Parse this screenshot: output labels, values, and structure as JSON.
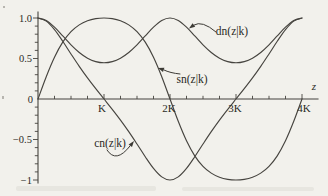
{
  "figure": {
    "background": "#f2f1ec",
    "ink": "#46443f",
    "text_color": "#2b2a25"
  },
  "chart_data": {
    "type": "line",
    "xlabel": "z",
    "x_unit_symbol": "K",
    "grid": false,
    "legend": "none (curves labeled with arrows)",
    "xlim_in_K": [
      0,
      4.25
    ],
    "ylim": [
      -1.05,
      1.05
    ],
    "x_minor_tick_step_in_K": 0.25,
    "y_minor_tick_step": 0.1,
    "x_ticks": [
      {
        "label": "K",
        "u": 1
      },
      {
        "label": "2K",
        "u": 2
      },
      {
        "label": "3K",
        "u": 3
      },
      {
        "label": "4K",
        "u": 4
      }
    ],
    "y_ticks": [
      {
        "label": "1.0",
        "v": 1
      },
      {
        "label": "0.5",
        "v": 0.5
      },
      {
        "label": "0",
        "v": 0
      },
      {
        "label": "−0.5",
        "v": -0.5
      },
      {
        "label": "−1",
        "v": -1
      }
    ],
    "u": [
      0,
      0.125,
      0.25,
      0.375,
      0.5,
      0.625,
      0.75,
      0.875,
      1,
      1.125,
      1.25,
      1.375,
      1.5,
      1.625,
      1.75,
      1.875,
      2,
      2.125,
      2.25,
      2.375,
      2.5,
      2.625,
      2.75,
      2.875,
      3,
      3.125,
      3.25,
      3.375,
      3.5,
      3.625,
      3.75,
      3.875,
      4
    ],
    "series": [
      {
        "name": "sn(z|k)",
        "values": [
          0,
          0.2756,
          0.5159,
          0.7015,
          0.8312,
          0.9153,
          0.9657,
          0.9919,
          1,
          0.9919,
          0.9657,
          0.9153,
          0.8312,
          0.7015,
          0.5159,
          0.2756,
          0,
          -0.2756,
          -0.5159,
          -0.7015,
          -0.8312,
          -0.9153,
          -0.9657,
          -0.9919,
          -1,
          -0.9919,
          -0.9657,
          -0.9153,
          -0.8312,
          -0.7015,
          -0.5159,
          -0.2756,
          0
        ]
      },
      {
        "name": "cn(z|k)",
        "values": [
          1,
          0.9613,
          0.8567,
          0.7127,
          0.5558,
          0.4029,
          0.2601,
          0.1271,
          0,
          -0.1271,
          -0.2601,
          -0.4029,
          -0.5558,
          -0.7127,
          -0.8567,
          -0.9613,
          -1,
          -0.9613,
          -0.8567,
          -0.7127,
          -0.5558,
          -0.4029,
          -0.2601,
          -0.1271,
          0,
          0.1271,
          0.2601,
          0.4029,
          0.5558,
          0.7127,
          0.8567,
          0.9613,
          1
        ]
      },
      {
        "name": "dn(z|k)",
        "values": [
          1,
          0.9691,
          0.8872,
          0.7787,
          0.6687,
          0.5743,
          0.5041,
          0.4615,
          0.4472,
          0.4615,
          0.5041,
          0.5743,
          0.6687,
          0.7787,
          0.8872,
          0.9691,
          1,
          0.9691,
          0.8872,
          0.7787,
          0.6687,
          0.5743,
          0.5041,
          0.4615,
          0.4472,
          0.4615,
          0.5041,
          0.5743,
          0.6687,
          0.7787,
          0.8872,
          0.9691,
          1
        ]
      }
    ],
    "annotations": [
      {
        "text": "dn(z|k)",
        "points_to": "dn curve"
      },
      {
        "text": "sn(z|k)",
        "points_to": "sn curve"
      },
      {
        "text": "cn(z|k)",
        "points_to": "cn curve"
      }
    ]
  }
}
